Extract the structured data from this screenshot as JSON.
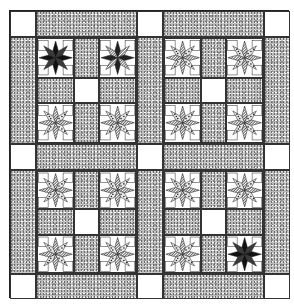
{
  "colors": {
    "background": "#ffffff",
    "speckle_gray": "#b9b9b9",
    "outline": "#222222",
    "dark_star": "#1a1a1a",
    "stripe_star": "#8a8a8a"
  },
  "layout": {
    "rows": [
      "corner",
      "sashing",
      "cornerstone",
      "sashing",
      "corner"
    ],
    "blocks": 4,
    "stars_per_block": 4
  },
  "blocks": [
    {
      "position": "top-left",
      "stars": [
        "dark",
        "mixed",
        "striped",
        "striped"
      ]
    },
    {
      "position": "top-right",
      "stars": [
        "striped",
        "striped",
        "striped",
        "striped"
      ]
    },
    {
      "position": "bottom-left",
      "stars": [
        "striped",
        "striped",
        "striped",
        "striped"
      ]
    },
    {
      "position": "bottom-right",
      "stars": [
        "striped",
        "striped",
        "striped",
        "dark"
      ]
    }
  ]
}
